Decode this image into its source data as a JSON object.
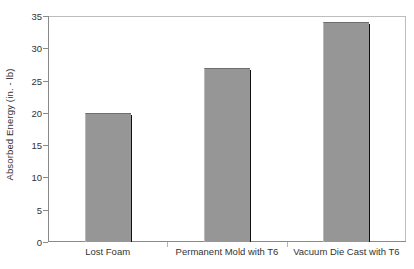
{
  "chart_data": {
    "type": "bar",
    "title": "",
    "xlabel": "",
    "ylabel": "Absorbed Energy (in. - lb)",
    "categories": [
      "Lost Foam",
      "Permanent Mold with T6",
      "Vacuum Die Cast with T6"
    ],
    "values": [
      20,
      27,
      34
    ],
    "ylim": [
      0,
      35
    ],
    "ytick_labels": [
      "0",
      "5",
      "10",
      "15",
      "20",
      "25",
      "30",
      "35"
    ],
    "ytick_values": [
      0,
      5,
      10,
      15,
      20,
      25,
      30,
      35
    ],
    "grid": false,
    "legend": null,
    "bar_color": "#969696",
    "bar_shadow_color": "#111111",
    "axis_color": "#8a8a8a",
    "frame_color": "#bdbdbd",
    "background_color": "#ffffff",
    "text_color": "#333333"
  }
}
